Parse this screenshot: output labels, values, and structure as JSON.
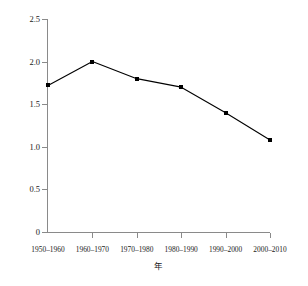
{
  "chart_data": {
    "type": "line",
    "title": "",
    "xlabel": "年",
    "ylabel": "人口增长率(每年的比例)",
    "categories": [
      "1950-1960",
      "1960-1970",
      "1970-1980",
      "1980-1990",
      "1990-2000",
      "2000-2010"
    ],
    "values": [
      1.72,
      2.0,
      1.8,
      1.7,
      1.4,
      1.08
    ],
    "series": [
      {
        "name": "人口增长率",
        "values": [
          1.72,
          2.0,
          1.8,
          1.7,
          1.4,
          1.08
        ]
      }
    ],
    "ylim": [
      0,
      2.5
    ],
    "yticks": [
      "0",
      "0.5",
      "1.0",
      "1.5",
      "2.0",
      "2.5"
    ],
    "ytick_values": [
      0,
      0.5,
      1.0,
      1.5,
      2.0,
      2.5
    ],
    "grid": false,
    "legend": false,
    "legend_position": "none",
    "marker": "square",
    "line_color": "#000000",
    "marker_color": "#000000",
    "axis_color": "#8a8a8a",
    "background_color": "#ffffff"
  }
}
